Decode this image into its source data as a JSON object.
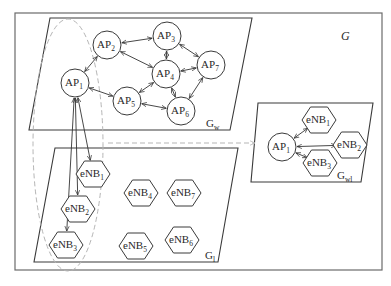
{
  "diagram": {
    "global_label": {
      "main": "G",
      "x": 341,
      "y": 40
    },
    "planes": [
      {
        "id": "Gw",
        "main": "G",
        "sub": "w",
        "points": "50,18 252,18 230,130 29,130",
        "lx": 206,
        "ly": 127
      },
      {
        "id": "Gl",
        "main": "G",
        "sub": "l",
        "points": "55,148 238,148 218,262 34,262",
        "lx": 205,
        "ly": 259
      },
      {
        "id": "Gwl",
        "main": "G",
        "sub": "wl",
        "points": "258,103 373,103 361,182 251,182",
        "lx": 337,
        "ly": 179
      }
    ],
    "ap_nodes": [
      {
        "id": "AP1",
        "main": "AP",
        "sub": "1",
        "cx": 75,
        "cy": 83
      },
      {
        "id": "AP2",
        "main": "AP",
        "sub": "2",
        "cx": 107,
        "cy": 45
      },
      {
        "id": "AP3",
        "main": "AP",
        "sub": "3",
        "cx": 167,
        "cy": 36
      },
      {
        "id": "AP4",
        "main": "AP",
        "sub": "4",
        "cx": 166,
        "cy": 74
      },
      {
        "id": "AP5",
        "main": "AP",
        "sub": "5",
        "cx": 127,
        "cy": 101
      },
      {
        "id": "AP6",
        "main": "AP",
        "sub": "6",
        "cx": 181,
        "cy": 111
      },
      {
        "id": "AP7",
        "main": "AP",
        "sub": "7",
        "cx": 211,
        "cy": 65
      },
      {
        "id": "AP1wl",
        "main": "AP",
        "sub": "1",
        "cx": 282,
        "cy": 147
      }
    ],
    "enb_nodes": [
      {
        "id": "eNB1",
        "main": "eNB",
        "sub": "1",
        "cx": 93,
        "cy": 174
      },
      {
        "id": "eNB2",
        "main": "eNB",
        "sub": "2",
        "cx": 78,
        "cy": 209
      },
      {
        "id": "eNB3",
        "main": "eNB",
        "sub": "3",
        "cx": 66,
        "cy": 245
      },
      {
        "id": "eNB4",
        "main": "eNB",
        "sub": "4",
        "cx": 141,
        "cy": 193
      },
      {
        "id": "eNB7",
        "main": "eNB",
        "sub": "7",
        "cx": 184,
        "cy": 193
      },
      {
        "id": "eNB5",
        "main": "eNB",
        "sub": "5",
        "cx": 136,
        "cy": 246
      },
      {
        "id": "eNB6",
        "main": "eNB",
        "sub": "6",
        "cx": 182,
        "cy": 240
      },
      {
        "id": "eNB1wl",
        "main": "eNB",
        "sub": "1",
        "cx": 319,
        "cy": 120
      },
      {
        "id": "eNB2wl",
        "main": "eNB",
        "sub": "2",
        "cx": 350,
        "cy": 145
      },
      {
        "id": "eNB3wl",
        "main": "eNB",
        "sub": "3",
        "cx": 320,
        "cy": 163
      }
    ],
    "edges": [
      [
        "AP1",
        "AP2"
      ],
      [
        "AP1",
        "AP5"
      ],
      [
        "AP2",
        "AP3"
      ],
      [
        "AP2",
        "AP4"
      ],
      [
        "AP3",
        "AP4"
      ],
      [
        "AP3",
        "AP7"
      ],
      [
        "AP4",
        "AP7"
      ],
      [
        "AP4",
        "AP5"
      ],
      [
        "AP4",
        "AP6"
      ],
      [
        "AP5",
        "AP6"
      ],
      [
        "AP6",
        "AP7"
      ],
      [
        "AP1",
        "eNB1"
      ],
      [
        "AP1",
        "eNB2"
      ],
      [
        "AP1",
        "eNB3"
      ],
      [
        "AP1wl",
        "eNB1wl"
      ],
      [
        "AP1wl",
        "eNB2wl"
      ],
      [
        "AP1wl",
        "eNB3wl"
      ]
    ]
  }
}
